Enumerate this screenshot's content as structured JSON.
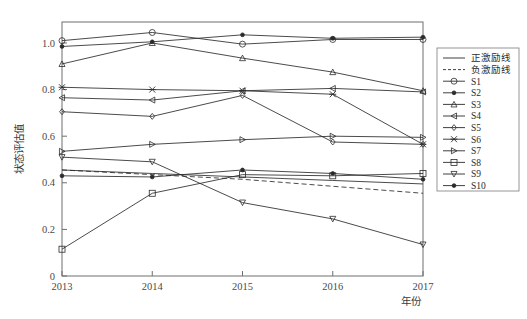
{
  "chart_data": {
    "type": "line",
    "title": "",
    "xlabel": "年份",
    "ylabel": "状态评估值",
    "x": [
      2013,
      2014,
      2015,
      2016,
      2017
    ],
    "xtick_labels": [
      "2013",
      "2014",
      "2015",
      "2016",
      "2017"
    ],
    "ytick_labels": [
      "0",
      "0.2",
      "0.4",
      "0.6",
      "0.8",
      "1.0"
    ],
    "ytick_values": [
      0,
      0.2,
      0.4,
      0.6,
      0.8,
      1.0
    ],
    "xlim": [
      2013,
      2017
    ],
    "ylim": [
      0,
      1.09
    ],
    "grid": false,
    "legend_position": "right-outside",
    "series": [
      {
        "name": "正激励线",
        "marker": "none",
        "linestyle": "solid",
        "values": [
          0.455,
          0.44,
          0.425,
          0.41,
          0.395
        ]
      },
      {
        "name": "负激励线",
        "marker": "none",
        "linestyle": "dashed",
        "values": [
          0.455,
          0.435,
          0.415,
          0.385,
          0.355
        ]
      },
      {
        "name": "S1",
        "marker": "circle-open",
        "linestyle": "solid",
        "values": [
          1.01,
          1.045,
          0.995,
          1.015,
          1.015
        ]
      },
      {
        "name": "S2",
        "marker": "dot",
        "linestyle": "solid",
        "values": [
          0.985,
          1.005,
          1.035,
          1.02,
          1.025
        ]
      },
      {
        "name": "S3",
        "marker": "triangle-up",
        "linestyle": "solid",
        "values": [
          0.91,
          1.0,
          0.935,
          0.875,
          0.795
        ]
      },
      {
        "name": "S4",
        "marker": "triangle-left",
        "linestyle": "solid",
        "values": [
          0.765,
          0.755,
          0.795,
          0.805,
          0.79
        ]
      },
      {
        "name": "S5",
        "marker": "diamond",
        "linestyle": "solid",
        "values": [
          0.705,
          0.685,
          0.775,
          0.575,
          0.565
        ]
      },
      {
        "name": "S6",
        "marker": "x",
        "linestyle": "solid",
        "values": [
          0.81,
          0.8,
          0.795,
          0.78,
          0.565
        ]
      },
      {
        "name": "S7",
        "marker": "triangle-right",
        "linestyle": "solid",
        "values": [
          0.535,
          0.565,
          0.585,
          0.6,
          0.595
        ]
      },
      {
        "name": "S8",
        "marker": "square-open",
        "linestyle": "solid",
        "values": [
          0.115,
          0.355,
          0.435,
          0.43,
          0.44
        ]
      },
      {
        "name": "S9",
        "marker": "triangle-down",
        "linestyle": "solid",
        "values": [
          0.51,
          0.49,
          0.315,
          0.245,
          0.135
        ]
      },
      {
        "name": "S10",
        "marker": "dot",
        "linestyle": "solid",
        "values": [
          0.43,
          0.425,
          0.455,
          0.44,
          0.415
        ]
      }
    ]
  },
  "axes": {
    "y_title": "状态评估值",
    "x_title": "年份"
  },
  "legend": {
    "entries": [
      {
        "label": "正激励线"
      },
      {
        "label": "负激励线"
      },
      {
        "label": "S1"
      },
      {
        "label": "S2"
      },
      {
        "label": "S3"
      },
      {
        "label": "S4"
      },
      {
        "label": "S5"
      },
      {
        "label": "S6"
      },
      {
        "label": "S7"
      },
      {
        "label": "S8"
      },
      {
        "label": "S9"
      },
      {
        "label": "S10"
      }
    ]
  },
  "colors": {
    "line": "#2b2b2b",
    "axis": "#6e6e6e",
    "background": "#ffffff"
  }
}
